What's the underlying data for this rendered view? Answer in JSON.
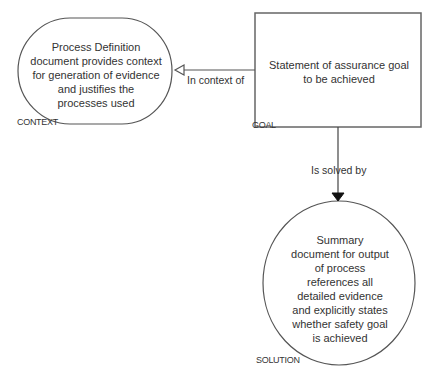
{
  "diagram": {
    "nodes": {
      "context": {
        "type": "CONTEXT",
        "text_lines": [
          "Process Definition",
          "document provides context",
          "for generation of evidence",
          "and justifies the",
          "processes used"
        ]
      },
      "goal": {
        "type": "GOAL",
        "text_lines": [
          "Statement of assurance goal",
          "to be achieved"
        ]
      },
      "solution": {
        "type": "SOLUTION",
        "text_lines": [
          "Summary",
          "document for output",
          "of process",
          "references all",
          "detailed evidence",
          "and explicitly states",
          "whether safety goal",
          "is achieved"
        ]
      }
    },
    "edges": [
      {
        "from": "goal",
        "to": "context",
        "label": "In context of",
        "arrowhead": "hollow"
      },
      {
        "from": "goal",
        "to": "solution",
        "label": "Is solved by",
        "arrowhead": "filled"
      }
    ]
  }
}
